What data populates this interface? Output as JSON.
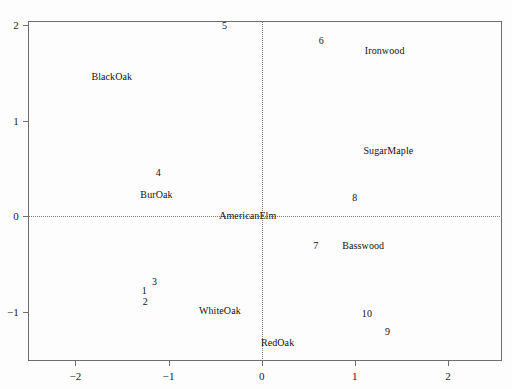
{
  "chart_data": {
    "type": "scatter",
    "title": "",
    "subtitle": "",
    "xlabel": "",
    "ylabel": "",
    "xlim": [
      -2.51,
      2.58
    ],
    "ylim": [
      -1.51,
      2.04
    ],
    "xticks": [
      -2,
      -1,
      0,
      1,
      2
    ],
    "xticklabels": [
      "−2",
      "−1",
      "0",
      "1",
      "2"
    ],
    "yticks": [
      -1,
      0,
      1,
      2
    ],
    "yticklabels": [
      "−1",
      "0",
      "1",
      "2"
    ],
    "grid": false,
    "legend": "none",
    "reference_lines": {
      "horizontal": 0,
      "vertical": 0,
      "style": "dotted",
      "color": "#7a7a7a"
    },
    "frame_color": "#6e6e6e",
    "text_color": "#111111",
    "background": "#fdfdfd",
    "series": [
      {
        "name": "observations",
        "marker": "text-number",
        "points": [
          {
            "label": "1",
            "x": -1.26,
            "y": -0.77
          },
          {
            "label": "2",
            "x": -1.25,
            "y": -0.88
          },
          {
            "label": "3",
            "x": -1.15,
            "y": -0.67
          },
          {
            "label": "4",
            "x": -1.11,
            "y": 0.46
          },
          {
            "label": "5",
            "x": -0.4,
            "y": 2.0
          },
          {
            "label": "6",
            "x": 0.64,
            "y": 1.84
          },
          {
            "label": "7",
            "x": 0.58,
            "y": -0.3
          },
          {
            "label": "8",
            "x": 1.0,
            "y": 0.2
          },
          {
            "label": "9",
            "x": 1.35,
            "y": -1.2
          },
          {
            "label": "10",
            "x": 1.13,
            "y": -1.01
          }
        ]
      },
      {
        "name": "variables",
        "marker": "text-name",
        "points": [
          {
            "label": "BlackOak",
            "x": -1.61,
            "y": 1.47
          },
          {
            "label": "BurOak",
            "x": -1.13,
            "y": 0.23
          },
          {
            "label": "WhiteOak",
            "x": -0.45,
            "y": -0.98
          },
          {
            "label": "AmericanElm",
            "x": -0.15,
            "y": 0.01
          },
          {
            "label": "RedOak",
            "x": 0.17,
            "y": -1.31
          },
          {
            "label": "Basswood",
            "x": 1.09,
            "y": -0.3
          },
          {
            "label": "SugarMaple",
            "x": 1.36,
            "y": 0.69
          },
          {
            "label": "Ironwood",
            "x": 1.32,
            "y": 1.74
          }
        ]
      }
    ]
  }
}
